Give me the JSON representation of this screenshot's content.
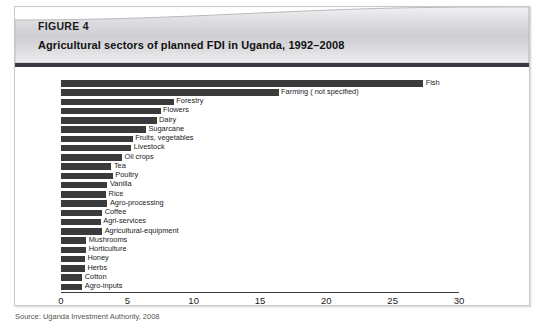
{
  "figure": {
    "label": "FIGURE 4",
    "title": "Agricultural sectors of planned FDI in Uganda, 1992–2008",
    "source": "Source: Uganda Investment Authority, 2008"
  },
  "colors": {
    "bar": "#3b3b3b",
    "header_bar": "#3a3a42",
    "frame": "#c8c8cc",
    "text": "#1a1a1a"
  },
  "chart_data": {
    "type": "bar",
    "orientation": "horizontal",
    "title": "Agricultural sectors of planned FDI in Uganda, 1992–2008",
    "xlabel": "",
    "ylabel": "",
    "xlim": [
      0,
      30
    ],
    "xticks": [
      0,
      5,
      10,
      15,
      20,
      25,
      30
    ],
    "grid": false,
    "legend": "none",
    "categories": [
      "Fish",
      "Farming ( not specified)",
      "Forestry",
      "Flowers",
      "Dairy",
      "Sugarcane",
      "Fruits, vegetables",
      "Livestock",
      "Oil crops",
      "Tea",
      "Poultry",
      "Vanilla",
      "Rice",
      "Agro-processing",
      "Coffee",
      "Agri-services",
      "Agricultural-equipment",
      "Mushrooms",
      "Horticulture",
      "Honey",
      "Herbs",
      "Cotton",
      "Agro-inputs"
    ],
    "values": [
      27.3,
      16.4,
      8.5,
      7.5,
      7.2,
      6.4,
      5.4,
      5.3,
      4.6,
      3.8,
      3.9,
      3.5,
      3.4,
      3.5,
      3.1,
      3.0,
      3.1,
      1.9,
      1.9,
      1.8,
      1.8,
      1.6,
      1.6
    ]
  }
}
